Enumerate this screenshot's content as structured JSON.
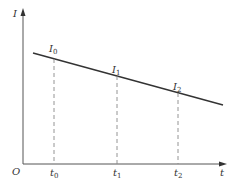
{
  "diagram": {
    "axes": {
      "y_label": "I",
      "x_label": "t",
      "origin_label": "O"
    },
    "line": {
      "description": "Linearly decreasing I vs t",
      "start": [
        33,
        53
      ],
      "end": [
        223,
        105
      ]
    },
    "points": [
      {
        "id": "p0",
        "value_label": "I",
        "value_sub": "0",
        "time_label": "t",
        "time_sub": "0",
        "x": 54
      },
      {
        "id": "p1",
        "value_label": "I",
        "value_sub": "1",
        "time_label": "t",
        "time_sub": "1",
        "x": 117
      },
      {
        "id": "p2",
        "value_label": "I",
        "value_sub": "2",
        "time_label": "t",
        "time_sub": "2",
        "x": 178
      }
    ],
    "colors": {
      "axis": "#555555",
      "line": "#333333",
      "dashed": "#888888",
      "text": "#333333"
    }
  }
}
